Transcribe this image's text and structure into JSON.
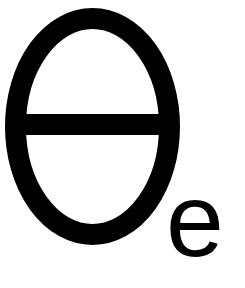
{
  "symbol": {
    "main": "θ",
    "subscript": "e",
    "name": "theta-e",
    "color": "#000000",
    "background": "#ffffff"
  }
}
